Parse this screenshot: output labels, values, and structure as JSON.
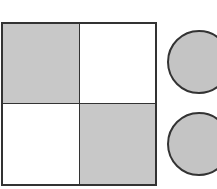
{
  "grid": {
    "rows": 2,
    "cols": 2,
    "cells": [
      {
        "row": 0,
        "col": 0,
        "shaded": true,
        "color": "#c8c8c8"
      },
      {
        "row": 0,
        "col": 1,
        "shaded": false,
        "color": "#ffffff"
      },
      {
        "row": 1,
        "col": 0,
        "shaded": false,
        "color": "#ffffff"
      },
      {
        "row": 1,
        "col": 1,
        "shaded": true,
        "color": "#c8c8c8"
      }
    ],
    "border_color": "#333333"
  },
  "circles": [
    {
      "shaded": true,
      "color": "#c4c4c4"
    },
    {
      "shaded": true,
      "color": "#c4c4c4"
    }
  ]
}
